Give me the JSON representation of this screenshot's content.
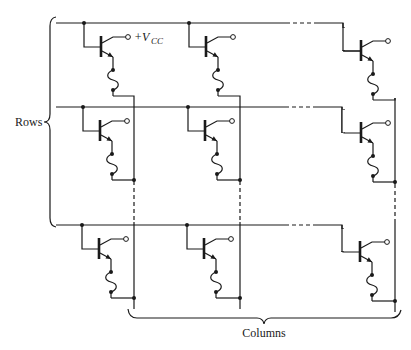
{
  "diagram": {
    "labels": {
      "rows": "Rows",
      "columns": "Columns",
      "vcc_prefix": "+V",
      "vcc_subscript": "CC"
    },
    "grid": {
      "row_count": 3,
      "column_count": 3,
      "row_lines_y": [
        23,
        107,
        225
      ],
      "column_lines_x": [
        134,
        240,
        395
      ]
    },
    "cells": [
      {
        "row": 1,
        "column": 1,
        "component": "npn-transistor + fuse",
        "collector": "+Vcc"
      },
      {
        "row": 1,
        "column": 2,
        "component": "npn-transistor + fuse",
        "collector": "+Vcc"
      },
      {
        "row": 1,
        "column": 3,
        "component": "npn-transistor + fuse",
        "collector": "+Vcc"
      },
      {
        "row": 2,
        "column": 1,
        "component": "npn-transistor + fuse",
        "collector": "+Vcc"
      },
      {
        "row": 2,
        "column": 2,
        "component": "npn-transistor + fuse",
        "collector": "+Vcc"
      },
      {
        "row": 2,
        "column": 3,
        "component": "npn-transistor + fuse",
        "collector": "+Vcc"
      },
      {
        "row": 3,
        "column": 1,
        "component": "npn-transistor + fuse",
        "collector": "+Vcc"
      },
      {
        "row": 3,
        "column": 2,
        "component": "npn-transistor + fuse",
        "collector": "+Vcc"
      },
      {
        "row": 3,
        "column": 3,
        "component": "npn-transistor + fuse",
        "collector": "+Vcc"
      }
    ],
    "colors": {
      "ink": "#1a1a1a",
      "background": "#ffffff"
    }
  }
}
